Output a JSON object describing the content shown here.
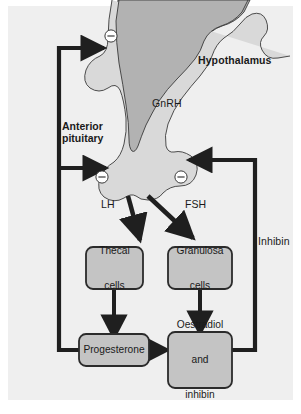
{
  "figure": {
    "type": "flow-diagram",
    "background_color": "#efefef",
    "page_color": "#ffffff"
  },
  "anatomy": {
    "hypothalamus": {
      "label": "Hypothalamus",
      "fill_color": "#b2b2b2",
      "bold": true
    },
    "anterior_pituitary": {
      "label": "Anterior\npituitary",
      "line1": "Anterior",
      "line2": "pituitary",
      "fill_color": "#d9d9d9",
      "bold": true
    }
  },
  "hormone_labels": {
    "gnrh": "GnRH",
    "lh": "LH",
    "fsh": "FSH",
    "inhibin": "Inhibin"
  },
  "boxes": [
    {
      "id": "thecal-cells",
      "line1": "Thecal",
      "line2": "cells",
      "fill_color": "#c4c4c4",
      "border_color": "#2b2b2b"
    },
    {
      "id": "granulosa-cells",
      "line1": "Granulosa",
      "line2": "cells",
      "fill_color": "#c4c4c4",
      "border_color": "#2b2b2b"
    },
    {
      "id": "progesterone",
      "line1": "Progesterone",
      "line2": "",
      "fill_color": "#c4c4c4",
      "border_color": "#2b2b2b"
    },
    {
      "id": "oestradiol-and-inhibin",
      "line1": "Oestradiol",
      "line2": "and",
      "line3": "inhibin",
      "fill_color": "#c4c4c4",
      "border_color": "#2b2b2b"
    }
  ],
  "feedback_signs": [
    {
      "id": "minus-hypothalamus",
      "symbol": "−",
      "meaning": "negative-feedback"
    },
    {
      "id": "minus-pituitary-left",
      "symbol": "−",
      "meaning": "negative-feedback"
    },
    {
      "id": "minus-pituitary-right",
      "symbol": "−",
      "meaning": "negative-feedback"
    }
  ],
  "arrows": {
    "stroke_color": "#1f1f1f",
    "description_lh": "Anterior pituitary to Thecal cells",
    "description_fsh": "Anterior pituitary to Granulosa cells",
    "description_thecal_to_progesterone": "Thecal cells to Progesterone",
    "description_granulosa_to_oestradiol": "Granulosa cells to Oestradiol and inhibin",
    "description_progesterone_to_oestradiol": "Progesterone to Oestradiol and inhibin",
    "description_feedback_left": "Progesterone back to hypothalamus and anterior pituitary",
    "description_feedback_right": "Oestradiol and inhibin back to anterior pituitary"
  }
}
